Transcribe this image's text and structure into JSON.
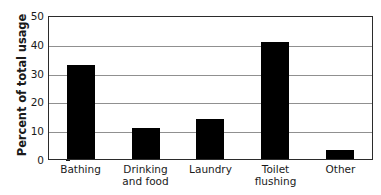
{
  "chart_data": {
    "type": "bar",
    "title": "",
    "xlabel": "",
    "ylabel": "Percent of total usage",
    "categories": [
      "Bathing",
      "Drinking\nand food",
      "Laundry",
      "Toilet\nflushing",
      "Other"
    ],
    "values": [
      32.5,
      10.8,
      14,
      40.5,
      3
    ],
    "ylim": [
      0,
      50
    ],
    "yticks": [
      0,
      10,
      20,
      30,
      40,
      50
    ],
    "ytick_labels": [
      "0",
      "10",
      "20",
      "30",
      "40",
      "50"
    ],
    "grid": "horizontal",
    "legend": "none",
    "bar_color": "#000000",
    "grid_color": "#909090",
    "axis_color": "#2b2b2b",
    "background": "#ffffff"
  }
}
